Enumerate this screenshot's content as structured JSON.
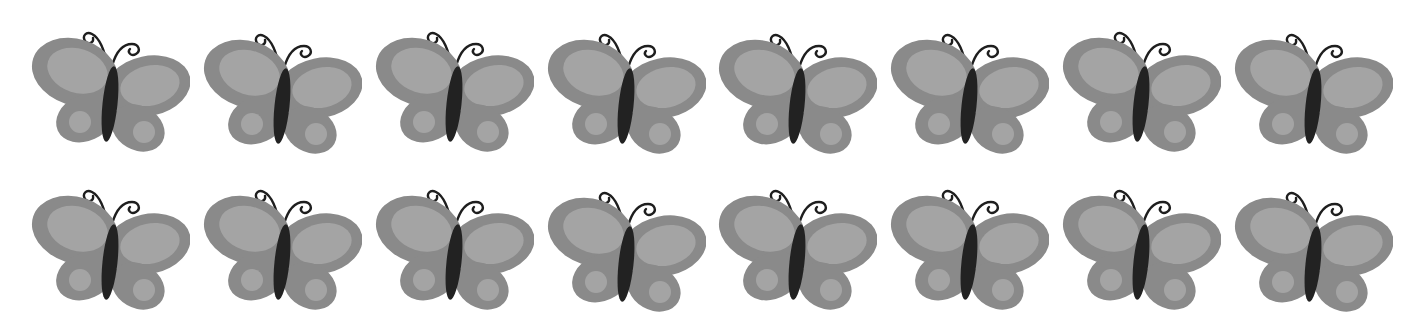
{
  "scene": {
    "description": "Two rows of eight identical gray cartoon butterflies",
    "rows": 2,
    "columns": 8,
    "total_count": 16
  },
  "colors": {
    "background": "#ffffff",
    "wing_outer": "#8a8a8a",
    "wing_inner": "#a4a4a4",
    "body": "#222222",
    "antenna": "#1e1e1e"
  },
  "butterflies": [
    {
      "row": 0,
      "col": 0,
      "x": 30,
      "y": 14
    },
    {
      "row": 0,
      "col": 1,
      "x": 202,
      "y": 16
    },
    {
      "row": 0,
      "col": 2,
      "x": 374,
      "y": 14
    },
    {
      "row": 0,
      "col": 3,
      "x": 546,
      "y": 16
    },
    {
      "row": 0,
      "col": 4,
      "x": 717,
      "y": 16
    },
    {
      "row": 0,
      "col": 5,
      "x": 889,
      "y": 16
    },
    {
      "row": 0,
      "col": 6,
      "x": 1061,
      "y": 14
    },
    {
      "row": 0,
      "col": 7,
      "x": 1233,
      "y": 16
    },
    {
      "row": 1,
      "col": 0,
      "x": 30,
      "y": 172
    },
    {
      "row": 1,
      "col": 1,
      "x": 202,
      "y": 172
    },
    {
      "row": 1,
      "col": 2,
      "x": 374,
      "y": 172
    },
    {
      "row": 1,
      "col": 3,
      "x": 546,
      "y": 174
    },
    {
      "row": 1,
      "col": 4,
      "x": 717,
      "y": 172
    },
    {
      "row": 1,
      "col": 5,
      "x": 889,
      "y": 172
    },
    {
      "row": 1,
      "col": 6,
      "x": 1061,
      "y": 172
    },
    {
      "row": 1,
      "col": 7,
      "x": 1233,
      "y": 174
    }
  ]
}
